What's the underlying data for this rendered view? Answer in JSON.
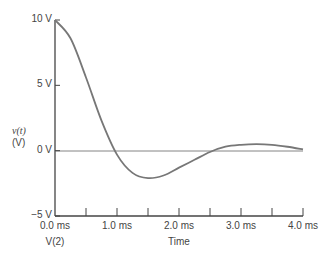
{
  "chart_data": {
    "type": "line",
    "title": "",
    "xlabel": "Time",
    "ylabel": "v(t)",
    "ylabel_unit": "(V)",
    "series_label": "V(2)",
    "xlim": [
      0,
      4.0
    ],
    "ylim": [
      -5,
      10
    ],
    "x_ticks": [
      "0.0 ms",
      "1.0 ms",
      "2.0 ms",
      "3.0 ms",
      "4.0 ms"
    ],
    "y_ticks": [
      "10 V",
      "5 V",
      "0 V",
      "−5 V"
    ],
    "grid": false,
    "series": [
      {
        "name": "V(2)",
        "x": [
          0,
          0.25,
          0.5,
          0.75,
          1.0,
          1.25,
          1.5,
          1.75,
          2.0,
          2.25,
          2.5,
          2.75,
          3.0,
          3.25,
          3.5,
          3.75,
          4.0
        ],
        "values": [
          10,
          8.6,
          5.6,
          2.3,
          -0.3,
          -1.7,
          -2.1,
          -1.9,
          -1.3,
          -0.7,
          -0.1,
          0.3,
          0.45,
          0.5,
          0.45,
          0.3,
          0.1
        ]
      }
    ]
  }
}
